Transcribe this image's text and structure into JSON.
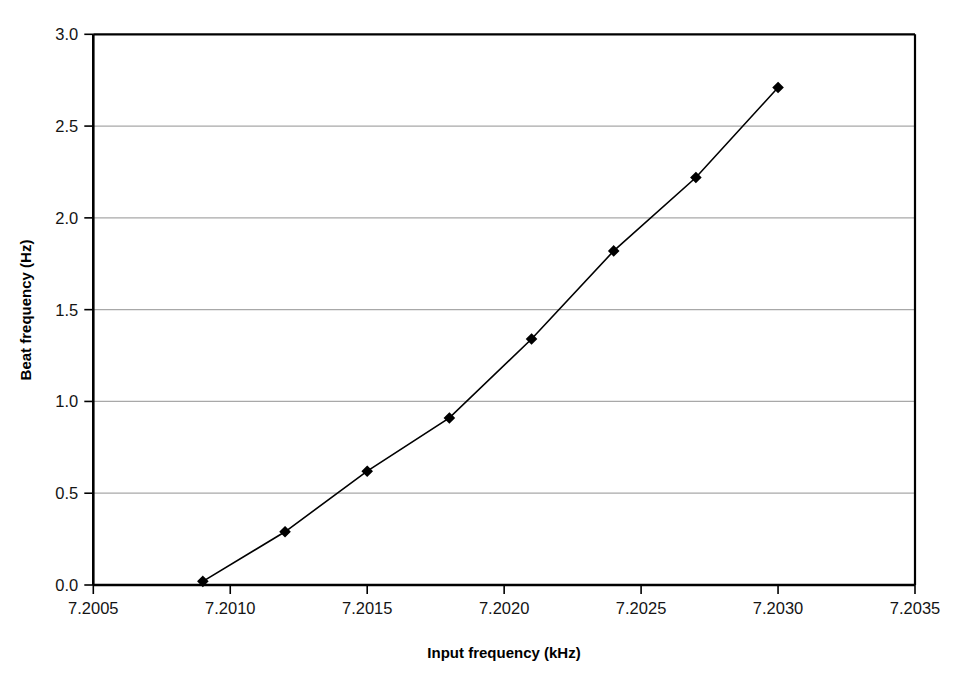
{
  "chart_data": {
    "type": "line",
    "title": "",
    "subtitle": "",
    "xlabel": "Input frequency (kHz)",
    "ylabel": "Beat frequency (Hz)",
    "xlim": [
      7.2005,
      7.2035
    ],
    "ylim": [
      0.0,
      3.0
    ],
    "xticks": [
      "7.2005",
      "7.2010",
      "7.2015",
      "7.2020",
      "7.2025",
      "7.2030",
      "7.2035"
    ],
    "xtick_values": [
      7.2005,
      7.201,
      7.2015,
      7.202,
      7.2025,
      7.203,
      7.2035
    ],
    "yticks": [
      "0.0",
      "0.5",
      "1.0",
      "1.5",
      "2.0",
      "2.5",
      "3.0"
    ],
    "ytick_values": [
      0.0,
      0.5,
      1.0,
      1.5,
      2.0,
      2.5,
      3.0
    ],
    "grid": "horizontal",
    "legend": "none",
    "annotations": [],
    "series": [
      {
        "name": "Beat frequency",
        "marker": "diamond",
        "marker_color": "#000000",
        "line_color": "#000000",
        "x": [
          7.2009,
          7.2012,
          7.2015,
          7.2018,
          7.2021,
          7.2024,
          7.2027,
          7.203
        ],
        "values": [
          0.02,
          0.29,
          0.62,
          0.91,
          1.34,
          1.82,
          2.22,
          2.71
        ]
      }
    ]
  },
  "style": {
    "background": "#ffffff",
    "axis_color": "#000000",
    "grid_color": "#a8a8a8",
    "text_color": "#141414"
  }
}
